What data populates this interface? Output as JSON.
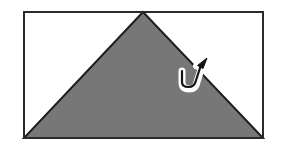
{
  "figure": {
    "canvas": {
      "width": 281,
      "height": 148,
      "background": "#ffffff"
    },
    "colors": {
      "background": "#ffffff",
      "frame_stroke": "#2b2b2b",
      "paper_fill": "#ffffff",
      "triangle_fill": "#777777",
      "triangle_stroke": "#1f1f1f",
      "arrow_outline": "#ffffff",
      "arrow_fill": "#141414"
    },
    "frame": {
      "name": "paper-sheet-rectangle",
      "x": 23,
      "y": 11,
      "width": 241,
      "height": 128,
      "stroke_width": 2
    },
    "triangle": {
      "name": "folded-flap-triangle",
      "apex": {
        "x": 143,
        "y": 12
      },
      "bottom_left": {
        "x": 24,
        "y": 138
      },
      "bottom_right": {
        "x": 263,
        "y": 138
      },
      "stroke_width": 2
    },
    "arrow": {
      "name": "fold-direction-arrow",
      "description": "white-outlined hooked arrow curving up and to the right",
      "tail": {
        "x": 184,
        "y": 84
      },
      "hook_low": {
        "x": 191,
        "y": 87
      },
      "tip": {
        "x": 207,
        "y": 60
      },
      "outline_width": 5
    },
    "labels": {
      "caption": "",
      "alt_text": "A rectangle containing a large shaded triangle whose apex touches the top edge and whose base spans the bottom edge; a small white-outlined curved arrow near the right side points up and to the right."
    }
  }
}
